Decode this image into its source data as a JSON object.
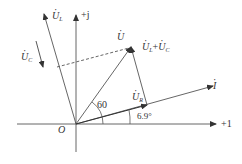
{
  "diagram": {
    "type": "phasor-diagram",
    "origin_label": "O",
    "axes": {
      "real": {
        "label": "+1"
      },
      "imag": {
        "label": "+j"
      }
    },
    "phasors": [
      {
        "id": "U",
        "symbol": "U",
        "label": "U̇"
      },
      {
        "id": "UL",
        "symbol": "U",
        "sub": "L",
        "label": "U̇_L"
      },
      {
        "id": "UC",
        "symbol": "U",
        "sub": "C",
        "label": "U̇_C"
      },
      {
        "id": "UR",
        "symbol": "U",
        "sub": "R",
        "label": "U̇_R"
      },
      {
        "id": "I",
        "symbol": "I",
        "label": "İ"
      },
      {
        "id": "ULUC",
        "label": "U̇_L+U̇_C",
        "part1": "U",
        "sub1": "L",
        "plus": "+",
        "part2": "U",
        "sub2": "C"
      }
    ],
    "angles": [
      {
        "label": "60",
        "between": "U and +1"
      },
      {
        "label": "6.9°",
        "between": "I and +1"
      }
    ]
  },
  "colors": {
    "stroke": "#444444",
    "text": "#333333"
  }
}
